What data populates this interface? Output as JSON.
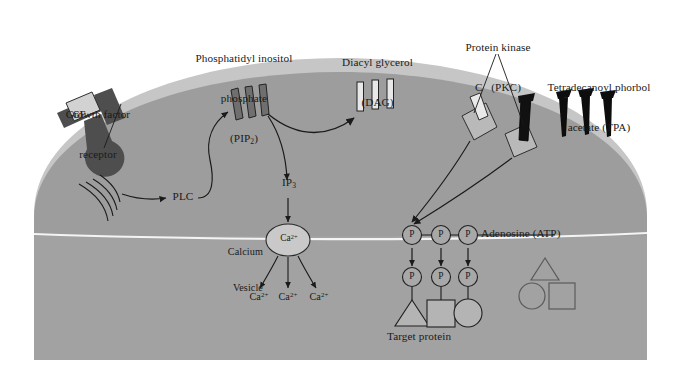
{
  "figure": {
    "colors": {
      "page_background": "#ffffff",
      "cytoplasm": "#9d9d9d",
      "membrane_outer": "#c6c6c6",
      "cytoplasm_lower": "#a3a3a3",
      "ink": "#1a1a1a",
      "receptor_dark": "#4e4e4e",
      "pip2_bar": "#6f6f6f",
      "dag_bar": "#e8e8e8",
      "tpa_bar": "#000000",
      "pkc_block": "#b9b9b9",
      "vesicle_fill": "#c9c9c9",
      "p_circle_fill": "#a8a8a8",
      "target_shape_fill": "#b4b4b4",
      "divider_line": "#f2f2f2"
    }
  },
  "labels": {
    "growth_factor_receptor": {
      "line1": "Growth factor",
      "line2": "receptor"
    },
    "gf_tag": "GF",
    "pip2": {
      "line1": "Phosphatidyl inositol",
      "line2": "phosphate",
      "line3_prefix": "(PIP",
      "line3_sub": "2",
      "line3_suffix": ")"
    },
    "dag": {
      "line1": "Diacyl glycerol",
      "line2": "(DAG)"
    },
    "pkc": {
      "line1": "Protein kinase",
      "line2": "C   (PKC)"
    },
    "tpa": {
      "line1": "Tetradecanoyl phorbol",
      "line2": "acetate (TPA)"
    },
    "plc": "PLC",
    "ip3": {
      "text": "IP",
      "sub": "3"
    },
    "calcium_vesicle": {
      "line1": "Calcium",
      "line2": "Vesicle"
    },
    "vesicle_ion": {
      "text": "Ca",
      "sup": "2+"
    },
    "released_ions": [
      {
        "text": "Ca",
        "sup": "2+"
      },
      {
        "text": "Ca",
        "sup": "2+"
      },
      {
        "text": "Ca",
        "sup": "2+"
      }
    ],
    "atp": "Adenosine (ATP)",
    "target_protein": "Target protein",
    "phosphate_glyph": "P"
  },
  "diagram": {
    "membrane_bars": {
      "pip2_count": 3,
      "dag_count": 3,
      "tpa_count": 3
    },
    "pkc_blocks": 2,
    "phosphate_row_top_count": 3,
    "phosphate_row_bottom_count": 3,
    "target_shapes": [
      "triangle",
      "square",
      "circle"
    ],
    "free_shapes": [
      "triangle",
      "circle",
      "square"
    ]
  }
}
